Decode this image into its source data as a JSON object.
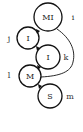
{
  "diagram": {
    "nodes": [
      {
        "id": "n1",
        "label": "MI",
        "side_label": "i"
      },
      {
        "id": "n2",
        "label": "I",
        "side_label": "j"
      },
      {
        "id": "n3",
        "label": "I",
        "side_label": "k"
      },
      {
        "id": "n4",
        "label": "M",
        "side_label": "l"
      },
      {
        "id": "n5",
        "label": "S",
        "side_label": "m"
      }
    ],
    "edges": [
      {
        "from": "n1",
        "to": "n2"
      },
      {
        "from": "n2",
        "to": "n3"
      },
      {
        "from": "n3",
        "to": "n4"
      },
      {
        "from": "n4",
        "to": "n5"
      },
      {
        "from": "n1",
        "to": "n4",
        "style": "curved"
      }
    ],
    "colors": {
      "stroke": "#111111",
      "background": "#ffffff"
    }
  }
}
